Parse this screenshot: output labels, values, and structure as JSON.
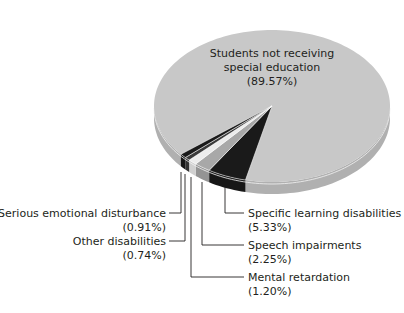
{
  "chart_data": {
    "type": "pie",
    "title": "",
    "style": "3d",
    "slices": [
      {
        "label": "Students not receiving special education",
        "value": 89.57,
        "value_label": "(89.57%)",
        "color": "#c8c8c8"
      },
      {
        "label": "Specific learning disabilities",
        "value": 5.33,
        "value_label": "(5.33%)",
        "color": "#1a1a1a"
      },
      {
        "label": "Speech impairments",
        "value": 2.25,
        "value_label": "(2.25%)",
        "color": "#a8a8a8"
      },
      {
        "label": "Mental retardation",
        "value": 1.2,
        "value_label": "(1.20%)",
        "color": "#ececec"
      },
      {
        "label": "Other disabilities",
        "value": 0.74,
        "value_label": "(0.74%)",
        "color": "#3a3a3a"
      },
      {
        "label": "Serious emotional disturbance",
        "value": 0.91,
        "value_label": "(0.91%)",
        "color": "#1a1a1a"
      }
    ]
  },
  "labels": {
    "main_line1": "Students not receiving",
    "main_line2": "special education",
    "main_value": "(89.57%)",
    "sld_name": "Specific learning disabilities",
    "sld_value": "(5.33%)",
    "speech_name": "Speech impairments",
    "speech_value": "(2.25%)",
    "mr_name": "Mental retardation",
    "mr_value": "(1.20%)",
    "other_name": "Other disabilities",
    "other_value": "(0.74%)",
    "sed_name": "Serious emotional disturbance",
    "sed_value": "(0.91%)"
  }
}
